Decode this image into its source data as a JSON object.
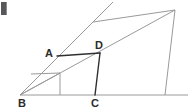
{
  "figure": {
    "type": "geometry-diagram",
    "canvas": {
      "width": 188,
      "height": 112,
      "background": "#ffffff"
    },
    "colors": {
      "thin_line": "#9a9a9c",
      "bold_line": "#2f2f31",
      "label_text": "#2b2b2b",
      "corner_mark": "#58585a"
    },
    "labels": {
      "A": "A",
      "B": "B",
      "C": "C",
      "D": "D"
    },
    "points": {
      "B": {
        "x": 20,
        "y": 95
      },
      "C": {
        "x": 95,
        "y": 95
      },
      "A": {
        "x": 57,
        "y": 56
      },
      "D": {
        "x": 100,
        "y": 53
      },
      "top_left": {
        "x": 93,
        "y": 22
      },
      "top_right": {
        "x": 175,
        "y": 10
      },
      "bottom_right": {
        "x": 165,
        "y": 95
      },
      "ray_end": {
        "x": 113,
        "y": 2
      },
      "inner_left": {
        "x": 31,
        "y": 74
      },
      "inner_right": {
        "x": 60,
        "y": 73
      },
      "inner_foot": {
        "x": 60,
        "y": 95
      },
      "baseline_left": {
        "x": 20,
        "y": 95
      },
      "baseline_right": {
        "x": 188,
        "y": 95
      }
    },
    "segments": [
      {
        "name": "baseline-BR",
        "from": "B",
        "to": "baseline_right",
        "weight": "thin"
      },
      {
        "name": "ray-B-through-topleft",
        "from": "B",
        "to": "ray_end",
        "weight": "thin"
      },
      {
        "name": "top-edge",
        "from": "top_left",
        "to": "top_right",
        "weight": "thin"
      },
      {
        "name": "diagonal-B-topright",
        "from": "B",
        "to": "top_right",
        "weight": "thin"
      },
      {
        "name": "right-side",
        "from": "top_right",
        "to": "bottom_right",
        "weight": "thin"
      },
      {
        "name": "segment-AD",
        "from": "A",
        "to": "D",
        "weight": "bold"
      },
      {
        "name": "segment-DC",
        "from": "D",
        "to": "C",
        "weight": "bold"
      },
      {
        "name": "inner-horizontal",
        "from": "inner_left",
        "to": "inner_right",
        "weight": "thin"
      },
      {
        "name": "inner-vertical",
        "from": "inner_right",
        "to": "inner_foot",
        "weight": "thin"
      },
      {
        "name": "inner-chord-B",
        "from": "B",
        "to": "inner_right",
        "weight": "thin"
      }
    ],
    "corner_mark": {
      "visible": true,
      "x": 1,
      "y": 2,
      "width": 5,
      "height": 13
    }
  }
}
